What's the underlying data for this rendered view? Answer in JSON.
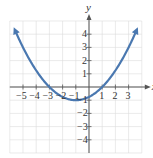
{
  "chart_data": {
    "type": "line",
    "title": "",
    "xlabel": "x",
    "ylabel": "y",
    "xlim": [
      -6,
      4
    ],
    "ylim": [
      -5,
      5
    ],
    "grid": true,
    "x_ticks": [
      -5,
      -4,
      -3,
      -2,
      -1,
      1,
      2,
      3
    ],
    "y_ticks": [
      4,
      3,
      2,
      1,
      -1,
      -2,
      -3,
      -4
    ],
    "x_tick_labels": [
      "−5",
      "−4",
      "−3",
      "−2",
      "−1",
      "1",
      "2",
      "3"
    ],
    "y_tick_labels": [
      "4",
      "3",
      "2",
      "1",
      "−1",
      "−2",
      "−3",
      "−4"
    ],
    "series": [
      {
        "name": "parabola",
        "equation": "y = (x+1)^2/4 - 1",
        "vertex": [
          -1,
          -1
        ],
        "x_intercepts": [
          -3,
          1
        ],
        "y_intercept": -0.75,
        "color": "#4a78b0",
        "arrows_both_ends": true
      }
    ]
  },
  "colors": {
    "curve": "#4a78b0",
    "grid": "#dcdcdc",
    "axis": "#555555"
  }
}
